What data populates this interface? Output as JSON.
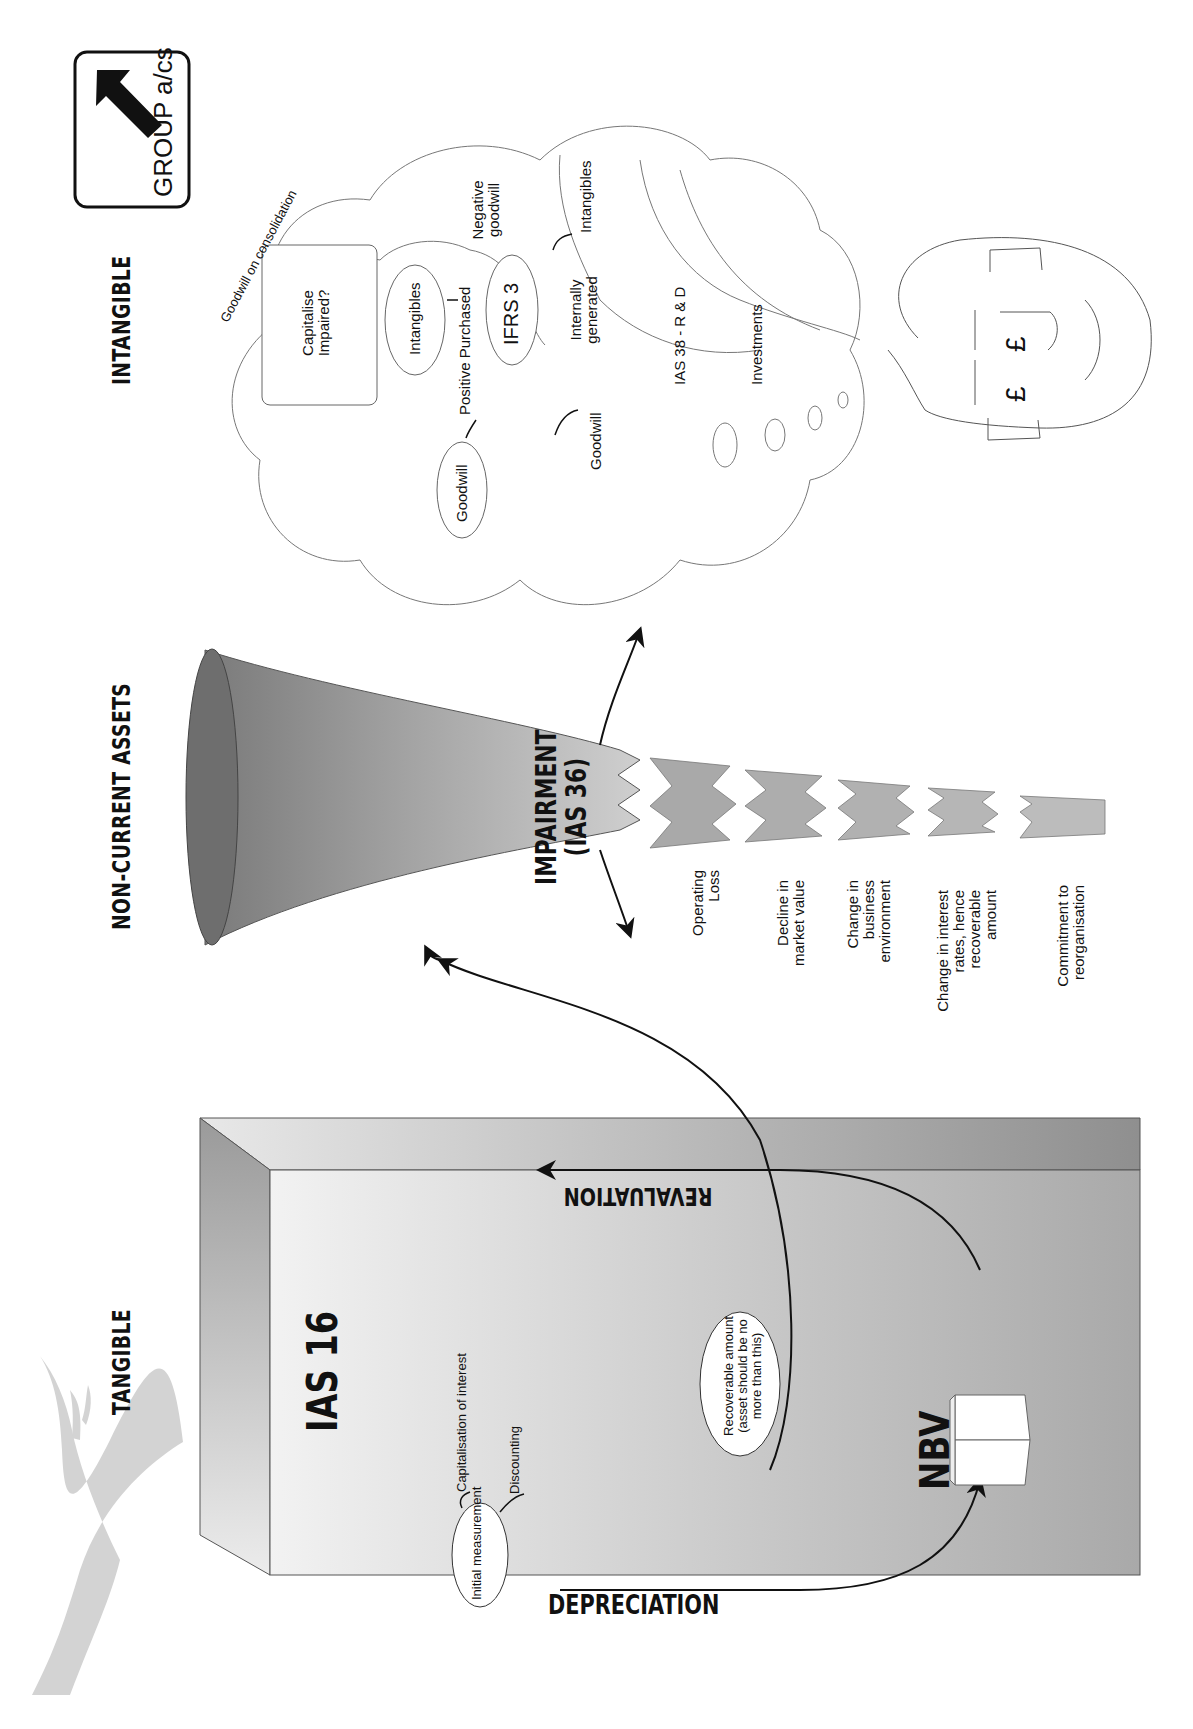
{
  "headings": {
    "tangible": "TANGIBLE",
    "non_current_assets": "NON-CURRENT ASSETS",
    "intangible": "INTANGIBLE"
  },
  "badge": {
    "label": "GROUP a/cs",
    "icon": "arrow-up-left-icon"
  },
  "tangible_box": {
    "standard": "IAS 16",
    "initial_measurement": "Initial measurement",
    "capitalisation": "Capitalisation of interest",
    "discounting": "Discounting",
    "depreciation": "DEPRECIATION",
    "nbv": "NBV",
    "revaluation": "REVALUATION",
    "recoverable": [
      "Recoverable amount",
      "(asset should be no",
      "more than this)"
    ]
  },
  "impairment": {
    "title": "IMPAIRMENT",
    "standard": "(IAS 36)",
    "indicators": [
      [
        "Operating",
        "Loss"
      ],
      [
        "Decline in",
        "market value"
      ],
      [
        "Change in",
        "business",
        "environment"
      ],
      [
        "Change in interest",
        "rates, hence",
        "recoverable",
        "amount"
      ],
      [
        "Commitment to",
        "reorganisation"
      ]
    ]
  },
  "cloud": {
    "goodwill_on_consolidation": "Goodwill on consolidation",
    "capitalise": [
      "Capitalise",
      "Impaired?"
    ],
    "intangibles_1": "Intangibles",
    "positive_purchased": "Positive Purchased",
    "goodwill_1": "Goodwill",
    "ifrs3": "IFRS 3",
    "negative_goodwill": [
      "Negative",
      "goodwill"
    ],
    "internally_generated": [
      "Internally",
      "generated"
    ],
    "intangibles_2": "Intangibles",
    "goodwill_2": "Goodwill",
    "ias38": "IAS 38 - R & D",
    "investments": "Investments"
  },
  "thinker": {
    "symbol_1": "£",
    "symbol_2": "£"
  },
  "colors": {
    "box_fill": "#c8c8c8",
    "box_side": "#9a9a9a",
    "cone_fill": "#a8a8a8",
    "tree": "#d0d0d0",
    "ink": "#111111"
  }
}
